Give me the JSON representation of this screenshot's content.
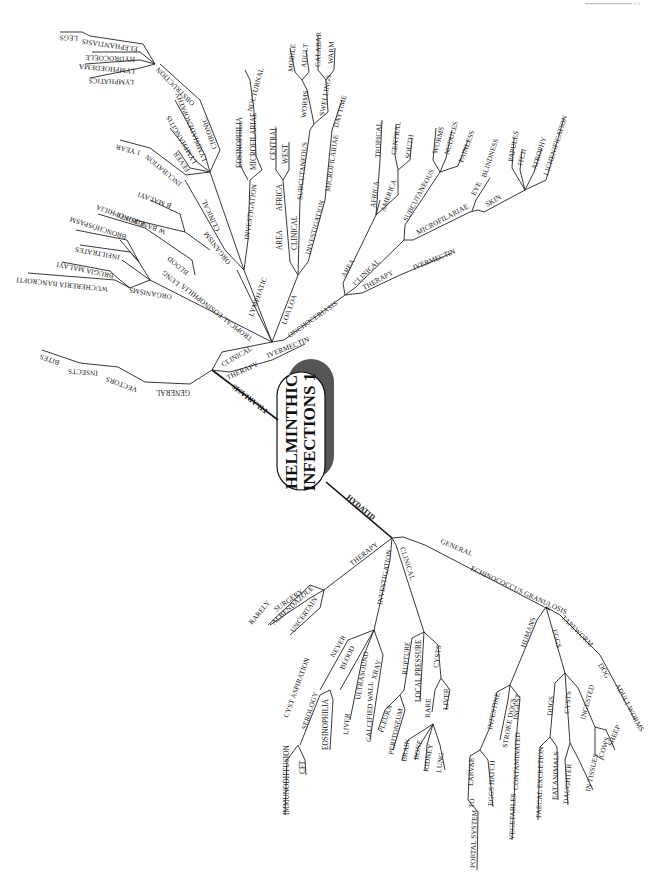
{
  "page": {
    "number_mark": "━━━━━━━━━━━  ≡≡"
  },
  "center": {
    "line1": "HELMINTHIC",
    "line2": "INFECTIONS 1"
  },
  "filariasis": {
    "label": "FILARIASIS",
    "general": {
      "label": "GENERAL",
      "vectors": "VECTORS",
      "insects": "INSECTS",
      "bites": "BITES"
    },
    "clinical": "CLINICAL",
    "therapy": {
      "label": "THERAPY",
      "ivermectin": "IVERMECTIN"
    },
    "tropical_eosinophilia": {
      "label": "TROPICAL EOSINOPHILIA",
      "organisms": {
        "label": "ORGANISMS",
        "wb": "WUCHERERIA BANCROFTI",
        "bm": "BRUGIA MALAYI"
      },
      "lung": {
        "label": "LUNG",
        "infiltrates": "INFILTRATES",
        "bronchospasm": "BRONCHOSPASM"
      },
      "blood": {
        "label": "BLOOD",
        "eosinophilia": "EOSINOPHILIA"
      }
    },
    "lymphatic": {
      "label": "LYMPHATIC",
      "organism": {
        "label": "ORGANISM",
        "wb": "W BANCROFTI",
        "bm": "B MALAYI"
      },
      "clinical": {
        "label": "CLINICAL",
        "incubation": "INCUBATION",
        "one_year": "1 YEAR",
        "fever": "FEVER",
        "lymphangitis": "LYMPHANGITIS",
        "lymphadenopathy": "LYMPHADENOPATHY",
        "chronic": "CHRONIC",
        "obstruction": {
          "label": "OBSTRUCTION",
          "lymphatics": "LYMPHATICS",
          "lymphoedema": "LYMPHOEDEMA",
          "hydrocoele": "HYDROCOELE",
          "elephantiasis": "ELEPHANTIASIS",
          "legs": "LEGS"
        }
      },
      "investigation": {
        "label": "INVESTIGATION",
        "eosinophilia": "EOSINOPHILIA",
        "microfilariae": "MICROFILARIAE",
        "nocturnal": "NOCTURNAL"
      }
    },
    "loa_loa": {
      "label": "LOA LOA",
      "area": {
        "label": "AREA",
        "africa": "AFRICA",
        "central": "CENTRAL",
        "west": "WEST"
      },
      "clinical": {
        "label": "CLINICAL",
        "subcutaneous": "SUBCUTANEOUS",
        "worms": "WORMS",
        "mobile": "MOBILE",
        "adult": "ADULT",
        "swellings": "SWELLINGS",
        "calabar": "CALABAR",
        "warm": "WARM"
      },
      "investigation": {
        "label": "INVESTIGATION",
        "microfilariae": "MICROFILARIAE",
        "daytime": "DAYTIME"
      }
    },
    "onchocerciasis": {
      "label": "ONCHOCERIASIS",
      "area": {
        "label": "AREA",
        "africa": "AFRICA",
        "tropical": "TROPICAL",
        "america": "AMERICA",
        "central": "CENTRAL",
        "south": "SOUTH"
      },
      "clinical": {
        "label": "CLINICAL",
        "subcutaneous": "SUBCUTANEOUS",
        "worms": "WORMS",
        "nodules": "NODULES",
        "painless": "PAINLESS",
        "microfilariae": "MICROFILARIAE",
        "eye": "EYE",
        "blindness": "BLINDNESS",
        "skin": "SKIN",
        "papules": "PAPULES",
        "itch": "ITCH",
        "atrophy": "ATROPHY",
        "lichenification": "LICHENIFICATION"
      },
      "therapy": {
        "label": "THERAPY",
        "ivermectin": "IVERMECTIN"
      }
    }
  },
  "hydatid": {
    "label": "HYDATID",
    "therapy": {
      "label": "THERAPY",
      "surgery": "SURGERY",
      "rarely": "RARELY",
      "albendazole": "ALBENDAZOLE",
      "uncertain": "UNCERTAIN"
    },
    "investigation": {
      "label": "INVESTIGATION",
      "never": "NEVER",
      "cyst_aspiration": "CYST ASPIRATION",
      "blood": "BLOOD",
      "serology": "SEROLOGY",
      "immunodiffusion": "IMMUNODIFFUSION",
      "cft": "CFT",
      "eosinophilia": "EOSINOPHILIA",
      "ultrasound": "ULTRASOUND",
      "liver": "LIVER",
      "xray": "XRAY",
      "calcified_wall": "CALCIFIED WALL"
    },
    "clinical": {
      "label": "CLINICAL",
      "rupture": "RUPTURE",
      "pleura": "PLEURA",
      "peritoneum": "PERITONEUM",
      "local_pressure": "LOCAL PRESSURE",
      "rare": "RARE",
      "brain": "BRAIN",
      "bone": "BONE",
      "kidney": "KIDNEY",
      "lung": "LUNG",
      "cysts": "CYSTS",
      "liver": "LIVER"
    },
    "general": {
      "label": "GENERAL",
      "eg": "ECHINOCOCCUS GRANULOSIS",
      "humans": {
        "label": "HUMANS",
        "intestine": "INTESTINE",
        "larvae": "LARVAE",
        "to": "TO",
        "portal_system": "PORTAL SYSTEM",
        "eggs_hatch": "EGGS HATCH",
        "stroke_dogs": "STROKE DOGS",
        "ingest": "INGEST",
        "contaminated": "CONTAMINATED",
        "vegetables": "VEGETABLES"
      },
      "eggs": {
        "label": "EGGS",
        "dogs": "DOGS",
        "faecal_excretion": "FAECAL EXCRETION",
        "eat_animals": "EAT ANIMALS",
        "cysts": "CYSTS",
        "daughter": "DAUGHTER",
        "in_tissues": "IN TISSUES",
        "ingested": "INGESTED",
        "cows": "COWS",
        "sheep": "SHEEP"
      },
      "tapeworm": {
        "label": "TAPEWORM",
        "dog": "DOG",
        "adult_worms": "ADULT WORMS"
      }
    }
  }
}
